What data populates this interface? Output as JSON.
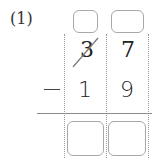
{
  "problem": {
    "label": "(1)",
    "operator": "−",
    "minuend": {
      "tens": "3",
      "ones": "7",
      "tens_crossed_out": true
    },
    "subtrahend": {
      "tens": "1",
      "ones": "9"
    },
    "borrow_boxes": {
      "tens": "",
      "ones": ""
    },
    "answer_boxes": {
      "tens": "",
      "ones": ""
    }
  }
}
